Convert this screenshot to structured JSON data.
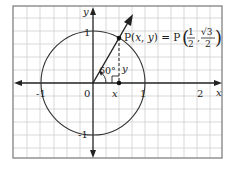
{
  "diagram": {
    "axes": {
      "x_label": "x",
      "y_label": "y",
      "origin_label": "0",
      "x_ticks": [
        "-1",
        "1",
        "2"
      ],
      "y_ticks": [
        "1",
        "-1"
      ]
    },
    "angle_label": "60°",
    "point_label": "P(x, y) = P",
    "point_coords": {
      "x_num": "1",
      "x_den": "2",
      "y_num": "√3",
      "y_den": "2"
    },
    "segment_labels": {
      "horizontal": "x",
      "vertical": "y"
    },
    "colors": {
      "grid": "#c8c8c8",
      "frame": "#888888",
      "axis": "#222222",
      "curve": "#333333"
    }
  }
}
